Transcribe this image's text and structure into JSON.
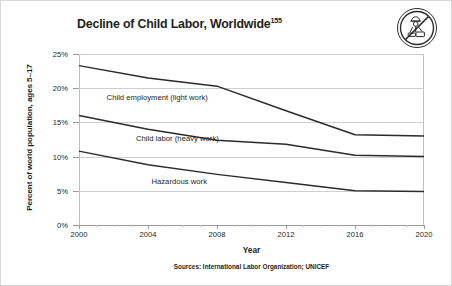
{
  "title": {
    "text": "Decline of Child Labor, Worldwide",
    "footnote": "155"
  },
  "icon": {
    "name": "no-child-labor-icon"
  },
  "source_note": "Sources: International Labor Organization; UNICEF",
  "chart_data": {
    "type": "line",
    "title": "Decline of Child Labor, Worldwide",
    "xlabel": "Year",
    "ylabel": "Percent of world population, ages 5–17",
    "x": [
      2000,
      2004,
      2008,
      2012,
      2016,
      2020
    ],
    "xlim": [
      2000,
      2020
    ],
    "ylim": [
      0,
      25
    ],
    "xtick_labels": [
      "2000",
      "2004",
      "2008",
      "2012",
      "2016",
      "2020"
    ],
    "ytick_labels": [
      "0%",
      "5%",
      "10%",
      "15%",
      "20%",
      "25%"
    ],
    "ytick_values": [
      0,
      5,
      10,
      15,
      20,
      25
    ],
    "grid": "horizontal",
    "legend": "inline-labels",
    "line_color": "#2b2b2b",
    "grid_color": "#cfcfcf",
    "series": [
      {
        "name": "Child employment (light work)",
        "label": "Child employment (light work)",
        "values": [
          23.3,
          21.5,
          20.3,
          16.7,
          13.2,
          13.0
        ],
        "label_x": 2001.6,
        "label_y": 18.6
      },
      {
        "name": "Child labor (heavy work)",
        "label": "Child labor (heavy work)",
        "values": [
          16.0,
          14.0,
          12.4,
          11.8,
          10.2,
          10.0
        ],
        "label_x": 2003.3,
        "label_y": 12.6
      },
      {
        "name": "Hazardous work",
        "label": "Hazardous work",
        "values": [
          10.8,
          8.8,
          7.4,
          6.2,
          5.0,
          4.9
        ],
        "label_x": 2004.2,
        "label_y": 6.3
      }
    ],
    "xtick_minor": [
      2001,
      2002,
      2003,
      2005,
      2006,
      2007,
      2009,
      2010,
      2011,
      2013,
      2014,
      2015,
      2017,
      2018,
      2019
    ]
  }
}
